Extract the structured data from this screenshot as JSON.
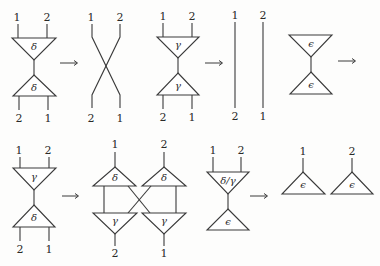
{
  "diagrams": {
    "row1": {
      "d1": {
        "top_labels": [
          "1",
          "2"
        ],
        "top_symbol": "δ",
        "bottom_symbol": "δ",
        "bottom_labels": [
          "2",
          "1"
        ]
      },
      "d2": {
        "top_labels": [
          "1",
          "2"
        ],
        "bottom_labels": [
          "2",
          "1"
        ],
        "kind": "crossing"
      },
      "d3": {
        "top_labels": [
          "1",
          "2"
        ],
        "top_symbol": "γ",
        "bottom_symbol": "γ",
        "bottom_labels": [
          "2",
          "1"
        ]
      },
      "d4": {
        "top_labels": [
          "1",
          "2"
        ],
        "bottom_labels": [
          "2",
          "1"
        ],
        "kind": "two-lines"
      },
      "d5": {
        "top_symbol": "ϵ",
        "bottom_symbol": "ϵ"
      }
    },
    "row2": {
      "d1": {
        "top_labels": [
          "1",
          "2"
        ],
        "top_symbol": "γ",
        "bottom_symbol": "δ",
        "bottom_labels": [
          "2",
          "1"
        ]
      },
      "d2": {
        "top_labels": [
          "1",
          "2"
        ],
        "upper_symbols": [
          "δ",
          "δ"
        ],
        "lower_symbols": [
          "γ",
          "γ"
        ],
        "bottom_labels": [
          "2",
          "1"
        ]
      },
      "d3": {
        "top_labels": [
          "1",
          "2"
        ],
        "top_symbol": "δ/γ",
        "bottom_symbol": "ϵ"
      },
      "d4": {
        "top_labels": [
          "1",
          "2"
        ],
        "symbols": [
          "ϵ",
          "ϵ"
        ]
      }
    }
  },
  "arrows": [
    "→",
    "→",
    "→",
    "→",
    "→",
    "→"
  ]
}
